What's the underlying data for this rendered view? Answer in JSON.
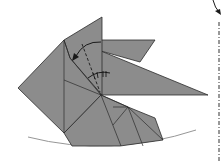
{
  "diagram": {
    "title": "",
    "colors": {
      "paper": "#8c8c8c",
      "lines": "#2b2b2b",
      "background": "#ffffff",
      "baseline": "#8a8a8a"
    },
    "symbols": [
      {
        "name": "valley-fold-line",
        "style": "dashed"
      },
      {
        "name": "fold-arrow",
        "direction": "counter-clockwise down-left"
      },
      {
        "name": "equal-angle-marks",
        "count": 2
      },
      {
        "name": "mountain-fold-line",
        "style": "dash-dot",
        "position": "right edge"
      },
      {
        "name": "incoming-arrow",
        "position": "top right"
      }
    ]
  }
}
